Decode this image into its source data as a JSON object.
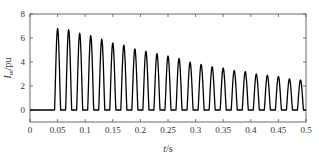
{
  "chart_data": {
    "type": "line",
    "title": "",
    "xlabel": "t/s",
    "ylabel": "I_m/pu",
    "ylabel_main": "I",
    "ylabel_sub": "m",
    "ylabel_unit": "/pu",
    "xlabel_var": "t",
    "xlabel_unit": "/s",
    "xlim": [
      0,
      0.5
    ],
    "ylim": [
      -1,
      8
    ],
    "xticks": [
      0,
      0.05,
      0.1,
      0.15,
      0.2,
      0.25,
      0.3,
      0.35,
      0.4,
      0.45,
      0.5
    ],
    "xtick_labels": [
      "0",
      "0.05",
      "0.1",
      "0.15",
      "0.2",
      "0.25",
      "0.3",
      "0.35",
      "0.4",
      "0.45",
      "0.5"
    ],
    "yticks": [
      0,
      2,
      4,
      6,
      8
    ],
    "ytick_labels": [
      "0",
      "2",
      "4",
      "6",
      "8"
    ],
    "grid": false,
    "legend": null,
    "line_color": "#000000",
    "onset_time": 0.045,
    "pulse_period": 0.02,
    "pulse_width": 0.011,
    "series": [
      {
        "name": "I_m",
        "peak_times": [
          0.05,
          0.07,
          0.09,
          0.11,
          0.13,
          0.15,
          0.17,
          0.19,
          0.21,
          0.23,
          0.25,
          0.27,
          0.29,
          0.31,
          0.33,
          0.35,
          0.37,
          0.39,
          0.41,
          0.43,
          0.45,
          0.47,
          0.49
        ],
        "peak_values": [
          6.8,
          6.7,
          6.4,
          6.2,
          5.9,
          5.6,
          5.4,
          5.1,
          4.9,
          4.7,
          4.5,
          4.3,
          4.0,
          3.8,
          3.6,
          3.5,
          3.3,
          3.2,
          3.0,
          2.9,
          2.8,
          2.6,
          2.5
        ],
        "baseline": 0
      }
    ]
  }
}
